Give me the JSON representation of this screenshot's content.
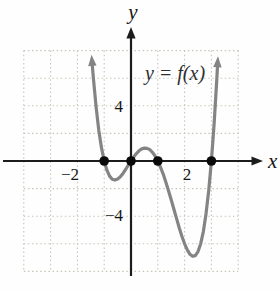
{
  "figure": {
    "equation_label": "y = f(x)",
    "x_axis_label": "x",
    "y_axis_label": "y",
    "ticks": {
      "x_neg": "−2",
      "x_pos": "2",
      "y_pos": "4",
      "y_neg": "−4"
    }
  },
  "colors": {
    "background": "#fefefe",
    "curve": "#848484",
    "axis": "#1c1c1c",
    "grid": "#c8c5b8",
    "dot": "#0a0a0a",
    "tick_label": "#151515",
    "equation_label": "#2e2e2e"
  },
  "chart_data": {
    "type": "line",
    "title": "y = f(x)",
    "xlabel": "x",
    "ylabel": "y",
    "x_range": [
      -4,
      4
    ],
    "y_range": [
      -8,
      8
    ],
    "grid_step_x": 1,
    "grid_step_y": 2,
    "grid_style": "dotted",
    "x_ticks_labeled": [
      -2,
      2
    ],
    "y_ticks_labeled": [
      4,
      -4
    ],
    "legend": "none",
    "annotation": "y = f(x)",
    "x_intercepts": [
      [
        -1,
        0
      ],
      [
        0,
        0
      ],
      [
        1,
        0
      ],
      [
        3,
        0
      ]
    ],
    "curve_points": [
      [
        -1.45,
        7.114
      ],
      [
        -1.4,
        5.914
      ],
      [
        -1.3,
        3.857
      ],
      [
        -1.2,
        2.218
      ],
      [
        -1.1,
        0.947
      ],
      [
        -1.0,
        0.0
      ],
      [
        -0.9,
        -0.667
      ],
      [
        -0.8,
        -1.094
      ],
      [
        -0.7,
        -1.321
      ],
      [
        -0.6,
        -1.382
      ],
      [
        -0.5,
        -1.313
      ],
      [
        -0.4,
        -1.142
      ],
      [
        -0.3,
        -0.901
      ],
      [
        -0.2,
        -0.614
      ],
      [
        -0.1,
        -0.307
      ],
      [
        0.0,
        0.0
      ],
      [
        0.1,
        0.287
      ],
      [
        0.2,
        0.538
      ],
      [
        0.3,
        0.737
      ],
      [
        0.4,
        0.874
      ],
      [
        0.5,
        0.938
      ],
      [
        0.6,
        0.922
      ],
      [
        0.7,
        0.821
      ],
      [
        0.8,
        0.634
      ],
      [
        0.9,
        0.359
      ],
      [
        1.0,
        0.0
      ],
      [
        1.1,
        -0.439
      ],
      [
        1.2,
        -0.95
      ],
      [
        1.3,
        -1.525
      ],
      [
        1.4,
        -2.15
      ],
      [
        1.5,
        -2.813
      ],
      [
        1.6,
        -3.494
      ],
      [
        1.7,
        -4.177
      ],
      [
        1.8,
        -4.838
      ],
      [
        1.9,
        -5.455
      ],
      [
        2.0,
        -6.0
      ],
      [
        2.1,
        -6.445
      ],
      [
        2.2,
        -6.758
      ],
      [
        2.3,
        -6.907
      ],
      [
        2.4,
        -6.854
      ],
      [
        2.5,
        -6.563
      ],
      [
        2.6,
        -5.99
      ],
      [
        2.7,
        -5.095
      ],
      [
        2.8,
        -3.83
      ],
      [
        2.9,
        -2.149
      ],
      [
        3.0,
        0.0
      ],
      [
        3.1,
        2.669
      ],
      [
        3.2,
        5.914
      ],
      [
        3.23,
        7.008
      ]
    ]
  }
}
